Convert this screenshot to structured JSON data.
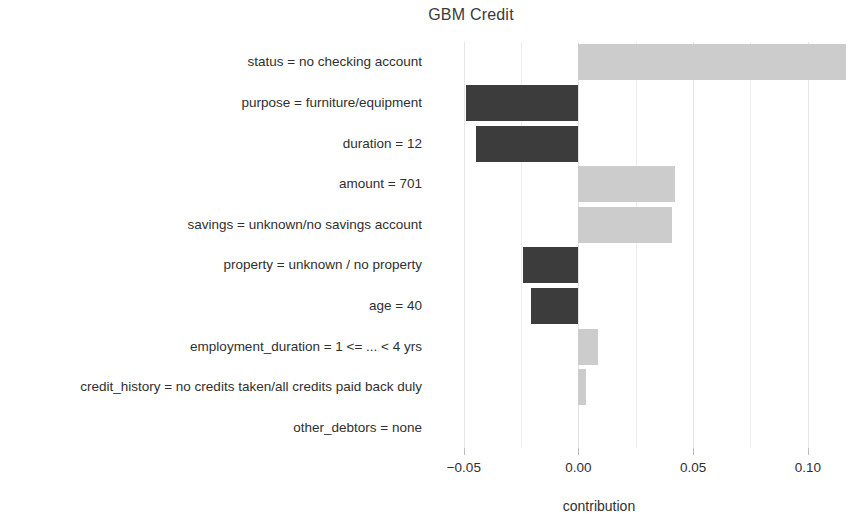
{
  "chart_data": {
    "type": "bar",
    "orientation": "horizontal",
    "title": "GBM Credit",
    "xlabel": "contribution",
    "ylabel": "",
    "xlim": [
      -0.063,
      0.1245
    ],
    "xticks": [
      -0.05,
      0.0,
      0.05,
      0.1
    ],
    "xtick_labels": [
      "−0.05",
      "0.00",
      "0.05",
      "0.10"
    ],
    "grid": "vertical",
    "gridlines_minor": [
      -0.025,
      0.025,
      0.075
    ],
    "legend": "none",
    "positive_color": "#cccccc",
    "negative_color": "#3c3c3c",
    "categories": [
      "status = no checking account",
      "purpose = furniture/equipment",
      "duration = 12",
      "amount = 701",
      "savings = unknown/no savings account",
      "property = unknown / no property",
      "age = 40",
      "employment_duration = 1 <= ... < 4 yrs",
      "credit_history = no credits taken/all credits paid back duly",
      "other_debtors = none"
    ],
    "values": [
      0.1165,
      -0.0492,
      -0.0445,
      0.0421,
      0.0409,
      -0.0244,
      -0.0209,
      0.0083,
      0.0035,
      0.0
    ]
  },
  "axis": {
    "x_title": "contribution"
  }
}
